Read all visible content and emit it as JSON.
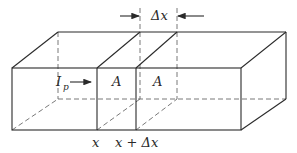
{
  "diagram": {
    "labels": {
      "current_symbol": "I",
      "current_subscript": "p",
      "area_left": "A",
      "area_right": "A",
      "position_x": "x",
      "position_x_dx": "x + Δx",
      "slice_width": "Δx"
    },
    "colors": {
      "line": "#2a2a2a",
      "hidden_line": "#6a6a6a",
      "background": "#ffffff"
    }
  }
}
